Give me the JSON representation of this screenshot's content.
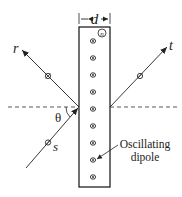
{
  "diagram": {
    "width_label": "d",
    "index_label": "n",
    "reflected_label": "r",
    "transmitted_label": "t",
    "source_label": "s",
    "angle_label": "θ",
    "annotation_line1": "Oscillating",
    "annotation_line2": "dipole",
    "dipole_count": 9,
    "colors": {
      "ink": "#222222",
      "background": "#ffffff"
    }
  }
}
